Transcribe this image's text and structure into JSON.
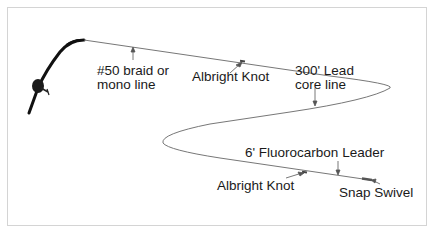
{
  "diagram": {
    "colors": {
      "line": "#777777",
      "rod": "#111111",
      "border": "#d4d4d4",
      "text": "#1a1a1a"
    },
    "labels": {
      "braid_line_1": "#50 braid or",
      "braid_line_2": "mono line",
      "albright_knot_top": "Albright Knot",
      "lead_core_1": "300' Lead",
      "lead_core_2": "core line",
      "fluorocarbon": "6' Fluorocarbon Leader",
      "albright_knot_bottom": "Albright Knot",
      "snap_swivel": "Snap Swivel"
    },
    "icons": [
      "fishing-rod-icon",
      "reel-icon"
    ]
  }
}
